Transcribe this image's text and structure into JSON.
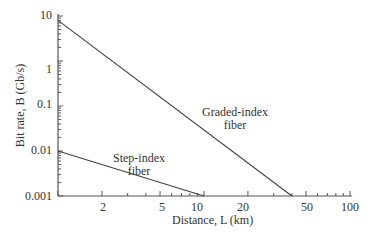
{
  "chart_data": {
    "type": "line",
    "title": "",
    "xlabel": "Distance, L (km)",
    "ylabel": "Bit rate, B (Gb/s)",
    "xscale": "log",
    "yscale": "log",
    "xlim": [
      1,
      100
    ],
    "ylim": [
      0.001,
      10
    ],
    "x_ticks": [
      "2",
      "5",
      "10",
      "20",
      "50",
      "100"
    ],
    "y_ticks": [
      "10",
      "1",
      "0.1",
      "0.01",
      "0.001"
    ],
    "grid": false,
    "series": [
      {
        "name": "Graded-index fiber",
        "x": [
          1,
          40
        ],
        "y": [
          8,
          0.001
        ]
      },
      {
        "name": "Step-index fiber",
        "x": [
          1,
          10
        ],
        "y": [
          0.01,
          0.001
        ]
      }
    ],
    "annotations": [
      {
        "text": "Graded-index fiber",
        "line1": "Graded-index",
        "line2": "fiber"
      },
      {
        "text": "Step-index fiber",
        "line1": "Step-index",
        "line2": "fiber"
      }
    ]
  }
}
